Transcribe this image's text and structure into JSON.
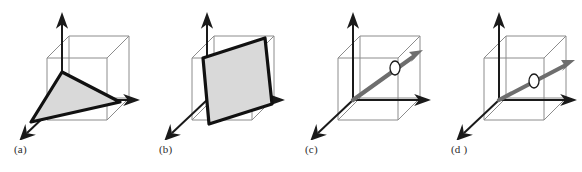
{
  "figure": {
    "background_color": "#ffffff",
    "width": 582,
    "height": 172,
    "panel_count": 4
  },
  "style": {
    "cube_edge_color": "#8c8c8c",
    "cube_edge_width": 1,
    "axis_color": "#1a1a1a",
    "axis_width": 2,
    "shape_outline_color": "#111111",
    "shape_outline_width": 3.2,
    "shape_fill_color": "#d9d9d9",
    "ray_color": "#6e6e6e",
    "ray_width": 4.2,
    "marker_fill_color": "#ffffff",
    "marker_stroke_color": "#1a1a1a",
    "caption_color": "#2b2b2b"
  },
  "panels": [
    {
      "id": "a",
      "caption": "(a)",
      "content_type": "shaded-triangle",
      "description": "A filled triangle spanning three points inside the wireframe cube, drawn with a heavy black outline.",
      "cube": {
        "front_bottom_left": [
          47,
          120
        ],
        "front_bottom_right": [
          107,
          120
        ],
        "front_top_left": [
          47,
          58
        ],
        "front_top_right": [
          107,
          58
        ],
        "depth_offset": [
          22,
          -22
        ]
      },
      "axes": {
        "z_tip": [
          62,
          17
        ],
        "x_tip": [
          136,
          100
        ],
        "y_tip": [
          22,
          138
        ],
        "origin": [
          62,
          100
        ]
      },
      "shape_vertices": [
        [
          62,
          72
        ],
        [
          31,
          122
        ],
        [
          120,
          102
        ]
      ],
      "marker": null
    },
    {
      "id": "b",
      "caption": "(b)",
      "content_type": "shaded-parallelogram",
      "description": "A filled parallelogram slab cutting through the wireframe cube, drawn with a heavy black outline.",
      "cube": {
        "front_bottom_left": [
          47,
          120
        ],
        "front_bottom_right": [
          107,
          120
        ],
        "front_top_left": [
          47,
          58
        ],
        "front_top_right": [
          107,
          58
        ],
        "depth_offset": [
          22,
          -22
        ]
      },
      "axes": {
        "z_tip": [
          62,
          17
        ],
        "x_tip": [
          136,
          100
        ],
        "y_tip": [
          22,
          138
        ],
        "origin": [
          62,
          100
        ]
      },
      "shape_vertices": [
        [
          58,
          58
        ],
        [
          120,
          38
        ],
        [
          127,
          104
        ],
        [
          64,
          124
        ]
      ],
      "marker": null
    },
    {
      "id": "c",
      "caption": "(c)",
      "content_type": "ray-with-intersection",
      "description": "A thick gray ray from the origin exiting through the right face of the cube, with a small open circle marking the intersection point.",
      "cube": {
        "front_bottom_left": [
          47,
          120
        ],
        "front_bottom_right": [
          107,
          120
        ],
        "front_top_left": [
          47,
          58
        ],
        "front_top_right": [
          107,
          58
        ],
        "depth_offset": [
          22,
          -22
        ]
      },
      "axes": {
        "z_tip": [
          62,
          17
        ],
        "x_tip": [
          136,
          100
        ],
        "y_tip": [
          22,
          138
        ],
        "origin": [
          62,
          100
        ]
      },
      "ray": {
        "start": [
          62,
          100
        ],
        "tip": [
          128,
          53
        ],
        "slope_label": "steep"
      },
      "marker": {
        "cx": 104,
        "cy": 68,
        "rx": 5,
        "ry": 7
      }
    },
    {
      "id": "d",
      "caption": "(d )",
      "content_type": "ray-with-intersection",
      "description": "A thick gray ray from the origin at a shallower angle, with a small open circle marking where it crosses the cube's interior vertical edge.",
      "cube": {
        "front_bottom_left": [
          47,
          120
        ],
        "front_bottom_right": [
          107,
          120
        ],
        "front_top_left": [
          47,
          58
        ],
        "front_top_right": [
          107,
          58
        ],
        "depth_offset": [
          22,
          -22
        ]
      },
      "axes": {
        "z_tip": [
          62,
          17
        ],
        "x_tip": [
          136,
          100
        ],
        "y_tip": [
          22,
          138
        ],
        "origin": [
          62,
          100
        ]
      },
      "ray": {
        "start": [
          62,
          100
        ],
        "tip": [
          133,
          62
        ],
        "slope_label": "shallow"
      },
      "marker": {
        "cx": 97,
        "cy": 81,
        "rx": 5,
        "ry": 7
      }
    }
  ]
}
